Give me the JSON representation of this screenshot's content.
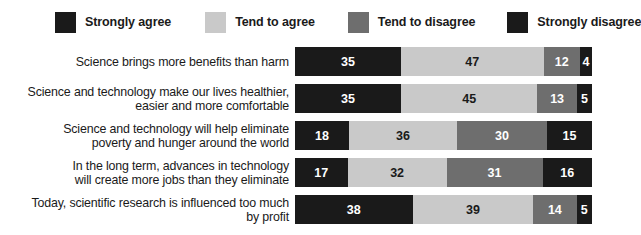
{
  "legend": {
    "items": [
      {
        "label": "Strongly agree",
        "color": "#1a1a1a",
        "swatch": "legend-swatch-strongly-agree"
      },
      {
        "label": "Tend to agree",
        "color": "#c9c9c9",
        "swatch": "legend-swatch-tend-to-agree"
      },
      {
        "label": "Tend to disagree",
        "color": "#6e6e6e",
        "swatch": "legend-swatch-tend-to-disagree"
      },
      {
        "label": "Strongly disagree",
        "color": "#1a1a1a",
        "swatch": "legend-swatch-strongly-disagree"
      }
    ]
  },
  "colors": {
    "strongly_agree": "#1a1a1a",
    "tend_to_agree": "#c9c9c9",
    "tend_to_disagree": "#6e6e6e",
    "strongly_disagree": "#1a1a1a",
    "value_on_dark": "#ffffff",
    "value_on_light": "#1a1a1a",
    "background": "#ffffff"
  },
  "chart_data": {
    "type": "bar",
    "title": "",
    "subtitle": "",
    "xlabel": "",
    "ylabel": "",
    "orientation": "horizontal",
    "stacked": true,
    "normalized_percent": true,
    "xlim": [
      0,
      100
    ],
    "grid": false,
    "legend_position": "top",
    "categories": [
      "Science brings more benefits than harm",
      "Science and technology make our lives healthier, easier and more comfortable",
      "Science and technology will help eliminate poverty and hunger around the world",
      "In the long term, advances in technology will create more jobs than they eliminate",
      "Today, scientific research is influenced too much by profit"
    ],
    "category_lines": [
      [
        "Science brings more benefits than harm"
      ],
      [
        "Science and technology make our lives healthier,",
        "easier and more comfortable"
      ],
      [
        "Science and technology will help eliminate",
        "poverty and hunger around the world"
      ],
      [
        "In the long term, advances in technology",
        "will create more jobs than they eliminate"
      ],
      [
        "Today, scientific research is influenced too much",
        "by profit"
      ]
    ],
    "series": [
      {
        "name": "Strongly agree",
        "values": [
          35,
          35,
          18,
          17,
          38
        ]
      },
      {
        "name": "Tend to agree",
        "values": [
          47,
          45,
          36,
          32,
          39
        ]
      },
      {
        "name": "Tend to disagree",
        "values": [
          12,
          13,
          30,
          31,
          14
        ]
      },
      {
        "name": "Strongly disagree",
        "values": [
          4,
          5,
          15,
          16,
          5
        ]
      }
    ]
  }
}
